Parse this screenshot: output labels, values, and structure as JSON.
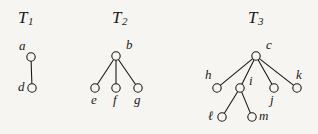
{
  "figure": {
    "background_color": "#f7f5f1",
    "ink_color": "#1c1a18",
    "node_fill": "#f7f5f1",
    "width": 318,
    "height": 134
  },
  "trees": [
    {
      "id": "T1",
      "title_main": "T",
      "title_sub": "1",
      "title_x": 18,
      "title_y": 8,
      "nodes": [
        {
          "id": "a",
          "label": "a",
          "cx": 31,
          "cy": 57,
          "r": 4.2,
          "label_x": 19,
          "label_y": 39
        },
        {
          "id": "d",
          "label": "d",
          "cx": 32,
          "cy": 88,
          "r": 4.2,
          "label_x": 18,
          "label_y": 80
        }
      ],
      "edges": [
        {
          "from": "a",
          "to": "d"
        }
      ]
    },
    {
      "id": "T2",
      "title_main": "T",
      "title_sub": "2",
      "title_x": 112,
      "title_y": 8,
      "nodes": [
        {
          "id": "b",
          "label": "b",
          "cx": 116,
          "cy": 56,
          "r": 4.2,
          "label_x": 126,
          "label_y": 38
        },
        {
          "id": "e",
          "label": "e",
          "cx": 95,
          "cy": 88,
          "r": 4.2,
          "label_x": 91,
          "label_y": 93
        },
        {
          "id": "f",
          "label": "f",
          "cx": 116,
          "cy": 88,
          "r": 4.2,
          "label_x": 113,
          "label_y": 93
        },
        {
          "id": "g",
          "label": "g",
          "cx": 138,
          "cy": 88,
          "r": 4.2,
          "label_x": 134,
          "label_y": 93
        }
      ],
      "edges": [
        {
          "from": "b",
          "to": "e"
        },
        {
          "from": "b",
          "to": "f"
        },
        {
          "from": "b",
          "to": "g"
        }
      ]
    },
    {
      "id": "T3",
      "title_main": "T",
      "title_sub": "3",
      "title_x": 248,
      "title_y": 8,
      "nodes": [
        {
          "id": "c",
          "label": "c",
          "cx": 256,
          "cy": 56,
          "r": 4.2,
          "label_x": 266,
          "label_y": 38
        },
        {
          "id": "h",
          "label": "h",
          "cx": 217,
          "cy": 88,
          "r": 4.2,
          "label_x": 205,
          "label_y": 68
        },
        {
          "id": "i",
          "label": "i",
          "cx": 240,
          "cy": 88,
          "r": 4.2,
          "label_x": 249,
          "label_y": 74
        },
        {
          "id": "j",
          "label": "j",
          "cx": 274,
          "cy": 88,
          "r": 4.2,
          "label_x": 270,
          "label_y": 93
        },
        {
          "id": "k",
          "label": "k",
          "cx": 297,
          "cy": 88,
          "r": 4.2,
          "label_x": 296,
          "label_y": 68
        },
        {
          "id": "l",
          "label": "ℓ",
          "cx": 222,
          "cy": 117,
          "r": 4.2,
          "label_x": 208,
          "label_y": 109
        },
        {
          "id": "m",
          "label": "m",
          "cx": 252,
          "cy": 117,
          "r": 4.2,
          "label_x": 259,
          "label_y": 109
        }
      ],
      "edges": [
        {
          "from": "c",
          "to": "h"
        },
        {
          "from": "c",
          "to": "i"
        },
        {
          "from": "c",
          "to": "j"
        },
        {
          "from": "c",
          "to": "k"
        },
        {
          "from": "i",
          "to": "l"
        },
        {
          "from": "i",
          "to": "m"
        }
      ]
    }
  ]
}
